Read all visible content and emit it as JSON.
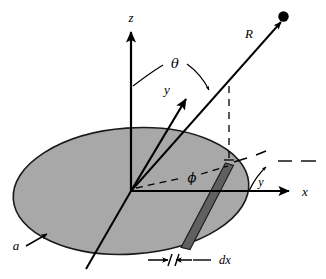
{
  "figure": {
    "kind": "physics-diagram",
    "background_color": "#ffffff",
    "ink_color": "#000000",
    "disk_fill_color": "#a8a8a8",
    "disk_stroke_color": "#1a1a1a",
    "strip_fill_color": "#606060",
    "strip_stroke_color": "#1a1a1a"
  },
  "labels": {
    "z_axis": "z",
    "x_axis": "x",
    "y_axis": "y",
    "radius_vector": "R",
    "polar_angle": "θ",
    "azimuthal_angle": "ϕ",
    "gamma_angle": "γ",
    "disk_radius": "a",
    "strip_width": "dx"
  },
  "geometry": {
    "origin": {
      "x": 131,
      "y": 191
    },
    "disk": {
      "center_x": 131,
      "center_y": 191,
      "radius_x": 118,
      "radius_y": 63,
      "rotation_deg": -4
    },
    "z_axis_tip": {
      "x": 131,
      "y": 26
    },
    "x_axis_tip": {
      "x": 288,
      "y": 191
    },
    "y_axis_tip": {
      "x": 185,
      "y": 97
    },
    "y_axis_back_end": {
      "x": 86,
      "y": 269
    },
    "field_point": {
      "x": 283,
      "y": 17
    },
    "drop_foot": {
      "x": 229,
      "y": 164
    },
    "strip_top": {
      "x": 229,
      "y": 164
    },
    "strip_bottom": {
      "x": 185,
      "y": 248
    },
    "theta_arc_label_pos": {
      "x": 174,
      "y": 62
    },
    "phi_label_pos": {
      "x": 192,
      "y": 180
    },
    "gamma_label_pos": {
      "x": 262,
      "y": 184
    },
    "a_label_pos": {
      "x": 19,
      "y": 244
    },
    "dx_label_pos": {
      "x": 228,
      "y": 262
    }
  }
}
